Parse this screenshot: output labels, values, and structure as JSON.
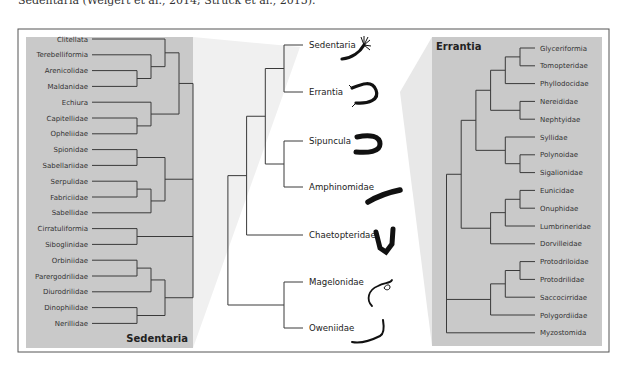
{
  "caption": "Sedentaria (Weigert et al., 2014; Struck et al., 2015).",
  "left_panel": {
    "title": "Sedentaria",
    "leaves": [
      "Clitellata",
      "Terebelliformia",
      "Arenicolidae",
      "Maldanidae",
      "Echiura",
      "Capitellidae",
      "Opheliidae",
      "Spionidae",
      "Sabellariidae",
      "Serpulidae",
      "Fabriciidae",
      "Sabellidae",
      "Cirratuliformia",
      "Siboglinidae",
      "Orbiniidae",
      "Parergodrilidae",
      "Diurodrilidae",
      "Dinophilidae",
      "Nerillidae"
    ],
    "tree": "(((Clitellata,(Terebelliformia,(Arenicolidae,Maldanidae))),(Echiura,(Capitellidae,Opheliidae))),((Spionidae,Sabellariidae),((Serpulidae,Fabriciidae),Sabellidae)),(Cirratuliformia,Siboglinidae),(((Orbiniidae,Parergodrilidae),Diurodrilidae),(Dinophilidae,Nerillidae)))"
  },
  "center_tree": {
    "leaves": [
      "Sedentaria",
      "Errantia",
      "Sipuncula",
      "Amphinomidae",
      "Chaetopteridae",
      "Magelonidae",
      "Oweniidae"
    ],
    "icons": [
      "sedentaria-worm-icon",
      "errantia-worm-icon",
      "sipuncula-worm-icon",
      "amphinomidae-worm-icon",
      "chaetopteridae-worm-icon",
      "magelonidae-worm-icon",
      "oweniidae-worm-icon"
    ],
    "tree": "((((Sedentaria,Errantia),(Sipuncula,Amphinomidae)),Chaetopteridae),(Magelonidae,Oweniidae))"
  },
  "right_panel": {
    "title": "Errantia",
    "leaves": [
      "Glyceriformia",
      "Tomopteridae",
      "Phyllodocidae",
      "Nereididae",
      "Nephtyidae",
      "Syllidae",
      "Polynoidae",
      "Sigalionidae",
      "Eunicidae",
      "Onuphidae",
      "Lumbrineridae",
      "Dorvilleidae",
      "Protodriloidae",
      "Protodrilidae",
      "Saccocirridae",
      "Polygordiidae",
      "Myzostomida"
    ],
    "tree": "((((((Glyceriformia,Tomopteridae),Phyllodocidae),(Nereididae,Nephtyidae)),(Syllidae,(Polynoidae,Sigalionidae))),(((Eunicidae,Onuphidae),Lumbrineridae),Dorvilleidae)),(((Protodriloidae,Protodrilidae),Saccocirridae),Polygordiidae),Myzostomida)"
  },
  "colors": {
    "panel": "#c9c9c9",
    "line": "#3a3a3a",
    "fan": "#ececec",
    "frame": "#555555"
  }
}
